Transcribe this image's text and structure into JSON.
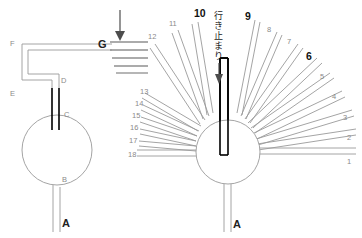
{
  "figure": {
    "title": "",
    "colors": {
      "tube_stroke": "#9a9a9a",
      "black_tube": "#000000",
      "label_gray": "#8a8a8a",
      "label_bold": "#111111",
      "arrow": "#4d4d4d",
      "background": "#ffffff"
    }
  },
  "left_panel": {
    "name": "single-tube-schematic",
    "labels": [
      {
        "id": "A",
        "text": "A",
        "x": 62,
        "y": 227,
        "style": "bold"
      },
      {
        "id": "B",
        "text": "B",
        "x": 62,
        "y": 182,
        "style": "small"
      },
      {
        "id": "C",
        "text": "C",
        "x": 64,
        "y": 117,
        "style": "small"
      },
      {
        "id": "D",
        "text": "D",
        "x": 61,
        "y": 83,
        "style": "small"
      },
      {
        "id": "E",
        "text": "E",
        "x": 10,
        "y": 96,
        "style": "small"
      },
      {
        "id": "F",
        "text": "F",
        "x": 10,
        "y": 46,
        "style": "small"
      },
      {
        "id": "G",
        "text": "G",
        "x": 100,
        "y": 46,
        "style": "bold"
      }
    ],
    "grate_line_count": 5,
    "arrow": {
      "label": "inflow-arrow",
      "direction": "down"
    }
  },
  "right_panel": {
    "name": "multi-tube-fan-schematic",
    "spoke_count": 18,
    "spoke_labels": [
      {
        "n": "1",
        "bold": false
      },
      {
        "n": "2",
        "bold": false
      },
      {
        "n": "3",
        "bold": false
      },
      {
        "n": "4",
        "bold": false
      },
      {
        "n": "5",
        "bold": false
      },
      {
        "n": "6",
        "bold": true
      },
      {
        "n": "7",
        "bold": false
      },
      {
        "n": "8",
        "bold": false
      },
      {
        "n": "9",
        "bold": true
      },
      {
        "n": "10",
        "bold": true
      },
      {
        "n": "11",
        "bold": false
      },
      {
        "n": "12",
        "bold": false
      },
      {
        "n": "13",
        "bold": false
      },
      {
        "n": "14",
        "bold": false
      },
      {
        "n": "15",
        "bold": false
      },
      {
        "n": "16",
        "bold": false
      },
      {
        "n": "17",
        "bold": false
      },
      {
        "n": "18",
        "bold": false
      }
    ],
    "annotation": {
      "text": "行き止まり",
      "meaning_label": "dead-end-annotation",
      "orientation": "vertical",
      "arrow_direction": "down"
    },
    "stem_label": {
      "id": "A",
      "text": "A"
    }
  }
}
